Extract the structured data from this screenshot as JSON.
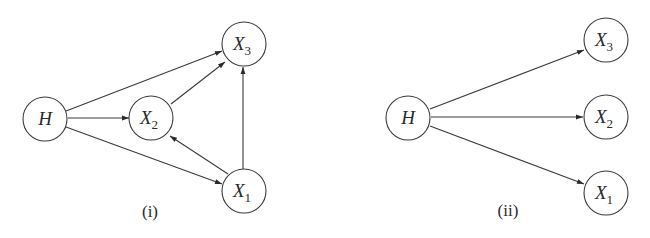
{
  "diagrams": [
    {
      "id": "i",
      "caption": "(i)",
      "nodes": [
        {
          "id": "H",
          "label": "H",
          "sub": ""
        },
        {
          "id": "X2",
          "label": "X",
          "sub": "2"
        },
        {
          "id": "X3",
          "label": "X",
          "sub": "3"
        },
        {
          "id": "X1",
          "label": "X",
          "sub": "1"
        }
      ],
      "edges": [
        {
          "from": "H",
          "to": "X3"
        },
        {
          "from": "H",
          "to": "X2"
        },
        {
          "from": "H",
          "to": "X1"
        },
        {
          "from": "X2",
          "to": "X3"
        },
        {
          "from": "X1",
          "to": "X2"
        },
        {
          "from": "X1",
          "to": "X3"
        }
      ]
    },
    {
      "id": "ii",
      "caption": "(ii)",
      "nodes": [
        {
          "id": "H",
          "label": "H",
          "sub": ""
        },
        {
          "id": "X3",
          "label": "X",
          "sub": "3"
        },
        {
          "id": "X2",
          "label": "X",
          "sub": "2"
        },
        {
          "id": "X1",
          "label": "X",
          "sub": "1"
        }
      ],
      "edges": [
        {
          "from": "H",
          "to": "X3"
        },
        {
          "from": "H",
          "to": "X2"
        },
        {
          "from": "H",
          "to": "X1"
        }
      ]
    }
  ]
}
